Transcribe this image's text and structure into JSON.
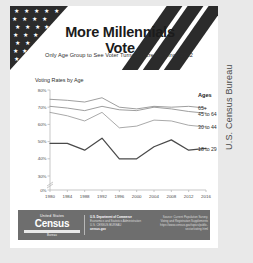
{
  "header": {
    "title": "More Millennials Vote",
    "subtitle": "Only Age Group to See Voter Turnout Increase Since 2012"
  },
  "credit": {
    "vertical_text": "U.S. Census Bureau"
  },
  "footer": {
    "logo_small": "United States",
    "logo_main": "Census",
    "logo_sub": "Bureau",
    "agency_line1": "U.S. Department of Commerce",
    "agency_line2": "Economics and Statistics Administration",
    "agency_line3": "U.S. CENSUS BUREAU",
    "agency_line4": "census.gov",
    "source_line1": "Source: Current Population Survey,",
    "source_line2": "Voting and Registration Supplements",
    "source_line3": "https://www.census.gov/topics/public-sector/voting.html"
  },
  "chart_data": {
    "type": "line",
    "title": "Voting Rates by Age",
    "xlabel": "",
    "ylabel": "",
    "grid": false,
    "legend_position": "right",
    "legend_title": "Ages",
    "axis_break": true,
    "ylim": [
      0,
      80
    ],
    "ytick_values": [
      0,
      30,
      40,
      50,
      60,
      70,
      80
    ],
    "ytick_labels": [
      "0%",
      "30%",
      "40%",
      "50%",
      "60%",
      "70%",
      "80%"
    ],
    "categories": [
      1980,
      1984,
      1988,
      1992,
      1996,
      2000,
      2004,
      2008,
      2012,
      2016
    ],
    "xtick_labels": [
      "1980",
      "1984",
      "1988",
      "1992",
      "1996",
      "2000",
      "2004",
      "2008",
      "2012",
      "2016"
    ],
    "series": [
      {
        "name": "65+",
        "color": "#8c8c8c",
        "values": [
          74.6,
          74.0,
          73.0,
          75.5,
          70.0,
          69.0,
          70.5,
          70.0,
          70.5,
          69.5
        ]
      },
      {
        "name": "45 to 64",
        "color": "#8c8c8c",
        "values": [
          70.5,
          69.5,
          68.0,
          70.5,
          68.5,
          68.0,
          70.0,
          69.0,
          67.5,
          66.5
        ]
      },
      {
        "name": "30 to 44",
        "color": "#9a9a9a",
        "values": [
          67.0,
          65.0,
          62.0,
          67.0,
          58.0,
          59.0,
          62.5,
          62.0,
          59.5,
          58.5
        ]
      },
      {
        "name": "18 to 29",
        "color": "#4a4a4a",
        "values": [
          49.0,
          49.0,
          45.0,
          52.0,
          40.0,
          40.0,
          47.0,
          51.0,
          45.0,
          46.0
        ]
      }
    ]
  }
}
